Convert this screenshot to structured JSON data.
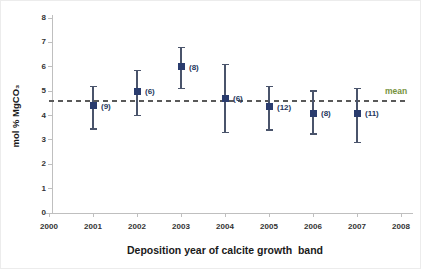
{
  "chart_data": {
    "type": "scatter",
    "title": "",
    "xlabel": "Deposition year of calcite growth  band",
    "ylabel": "mol % MgCO₃",
    "xlim": [
      2000,
      2008
    ],
    "ylim": [
      0,
      8
    ],
    "x_ticks": [
      2000,
      2001,
      2002,
      2003,
      2004,
      2005,
      2006,
      2007,
      2008
    ],
    "y_ticks": [
      0,
      1,
      2,
      3,
      4,
      5,
      6,
      7,
      8
    ],
    "grid": false,
    "legend": "none",
    "mean_line": {
      "value": 4.6,
      "label": "mean",
      "style": "dashed",
      "line_color": "#595959",
      "label_color": "#76923C"
    },
    "series": [
      {
        "marker": "filled-square",
        "marker_color": "#2A3C6E",
        "error_bar_color": "#4A546B",
        "count_label_color": "#24365C",
        "points": [
          {
            "year": 2001,
            "value": 4.4,
            "err_low": 3.45,
            "err_high": 5.2,
            "n_label": "(9)"
          },
          {
            "year": 2002,
            "value": 5.0,
            "err_low": 4.0,
            "err_high": 5.85,
            "n_label": "(6)"
          },
          {
            "year": 2003,
            "value": 6.0,
            "err_low": 5.1,
            "err_high": 6.8,
            "n_label": "(8)"
          },
          {
            "year": 2004,
            "value": 4.7,
            "err_low": 3.3,
            "err_high": 6.1,
            "n_label": "(6)"
          },
          {
            "year": 2005,
            "value": 4.35,
            "err_low": 3.4,
            "err_high": 5.2,
            "n_label": "(12)"
          },
          {
            "year": 2006,
            "value": 4.1,
            "err_low": 3.25,
            "err_high": 5.0,
            "n_label": "(8)"
          },
          {
            "year": 2007,
            "value": 4.1,
            "err_low": 2.9,
            "err_high": 5.1,
            "n_label": "(11)"
          }
        ]
      }
    ],
    "axis_color": "#BFBFBF",
    "tick_label_color": "#333333"
  }
}
